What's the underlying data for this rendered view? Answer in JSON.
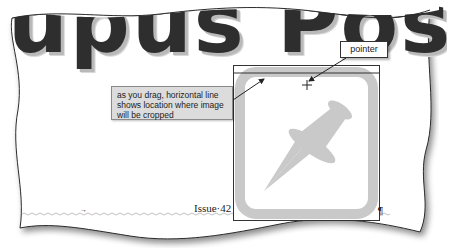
{
  "document": {
    "title_fragment": "upus Post it",
    "issue_line": "Issue·42",
    "pilcrow": "¶",
    "tab_mark": "→"
  },
  "annotations": {
    "crop_callout": "as you drag, horizontal line shows location where image will be cropped",
    "pointer_label": "pointer"
  },
  "picture": {
    "subject": "pushpin-icon",
    "fill_color": "#c9c9c9",
    "border_color": "#333333"
  },
  "colors": {
    "title_text": "#2e2e2e",
    "title_shadow": "#b9b9b9",
    "callout_bg": "#dcdcdc",
    "spell_underline": "#b0b0b0"
  }
}
